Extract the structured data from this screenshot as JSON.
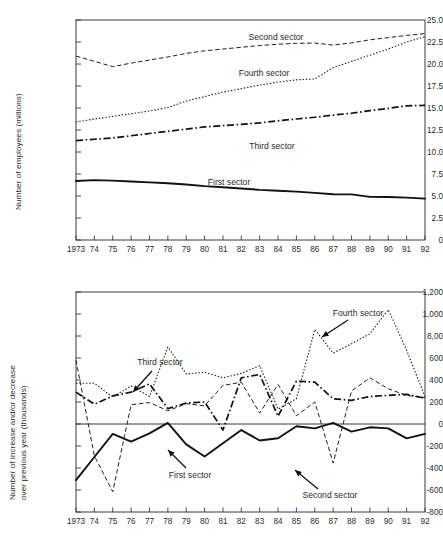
{
  "chart_data": [
    {
      "id": "employees",
      "type": "line",
      "title": "",
      "xlabel": "",
      "ylabel": "Number of employees (millions)",
      "x": [
        1973,
        1974,
        1975,
        1976,
        1977,
        1978,
        1979,
        1980,
        1981,
        1982,
        1983,
        1984,
        1985,
        1986,
        1987,
        1988,
        1989,
        1990,
        1991,
        1992
      ],
      "xticklabels": [
        "1973",
        "74",
        "75",
        "76",
        "77",
        "78",
        "79",
        "80",
        "81",
        "82",
        "83",
        "84",
        "85",
        "86",
        "87",
        "88",
        "89",
        "90",
        "91",
        "92"
      ],
      "yticklabels": [
        "0",
        "2.5",
        "5.0",
        "7.5",
        "10.0",
        "12.5",
        "15.0",
        "17.5",
        "20.0",
        "22.5",
        "25.0"
      ],
      "ytickvalues": [
        0,
        2.5,
        5.0,
        7.5,
        10.0,
        12.5,
        15.0,
        17.5,
        20.0,
        22.5,
        25.0
      ],
      "ylim": [
        0,
        25
      ],
      "xlim": [
        1973,
        1992
      ],
      "grid": false,
      "legend_position": "inline-annotations",
      "series": [
        {
          "name": "First sector",
          "style": "solid",
          "values": [
            6.7,
            6.8,
            6.75,
            6.65,
            6.55,
            6.45,
            6.3,
            6.12,
            6.0,
            5.85,
            5.7,
            5.6,
            5.5,
            5.35,
            5.2,
            5.18,
            4.9,
            4.88,
            4.82,
            4.7
          ]
        },
        {
          "name": "Second sector",
          "style": "dashed",
          "values": [
            20.9,
            20.3,
            19.7,
            20.1,
            20.45,
            20.8,
            21.2,
            21.5,
            21.7,
            21.9,
            22.1,
            22.25,
            22.35,
            22.38,
            22.15,
            22.4,
            22.75,
            23.0,
            23.25,
            23.45
          ]
        },
        {
          "name": "Third sector",
          "style": "dash-dot",
          "values": [
            11.3,
            11.45,
            11.6,
            11.85,
            12.1,
            12.35,
            12.6,
            12.85,
            13.0,
            13.15,
            13.3,
            13.55,
            13.75,
            13.95,
            14.2,
            14.4,
            14.7,
            14.95,
            15.25,
            15.3
          ]
        },
        {
          "name": "Fourth sector",
          "style": "dotted",
          "values": [
            13.4,
            13.75,
            14.05,
            14.35,
            14.65,
            15.05,
            15.8,
            16.3,
            16.8,
            17.2,
            17.6,
            17.95,
            18.2,
            18.3,
            19.6,
            20.3,
            21.0,
            21.7,
            22.5,
            23.1
          ]
        }
      ],
      "annotations": [
        {
          "text": "Second sector",
          "x_px": 276,
          "y_px": 37
        },
        {
          "text": "Fourth sector",
          "x_px": 264,
          "y_px": 73
        },
        {
          "text": "Third sector",
          "x_px": 272,
          "y_px": 146
        },
        {
          "text": "First sector",
          "x_px": 229,
          "y_px": 182
        }
      ]
    },
    {
      "id": "change",
      "type": "line",
      "title": "",
      "xlabel": "",
      "ylabel": "Number of increase and/or decrease over previous year (thousands)",
      "x": [
        1973,
        1974,
        1975,
        1976,
        1977,
        1978,
        1979,
        1980,
        1981,
        1982,
        1983,
        1984,
        1985,
        1986,
        1987,
        1988,
        1989,
        1990,
        1991,
        1992
      ],
      "xticklabels": [
        "1973",
        "74",
        "75",
        "76",
        "77",
        "78",
        "79",
        "80",
        "81",
        "82",
        "83",
        "84",
        "85",
        "86",
        "87",
        "88",
        "89",
        "90",
        "91",
        "92"
      ],
      "yticklabels": [
        "-800",
        "-600",
        "-400",
        "-200",
        "0",
        "200",
        "400",
        "600",
        "8,00",
        "1,000",
        "1,200"
      ],
      "ytickvalues": [
        -800,
        -600,
        -400,
        -200,
        0,
        200,
        400,
        600,
        800,
        1000,
        1200
      ],
      "ylim": [
        -800,
        1200
      ],
      "xlim": [
        1973,
        1992
      ],
      "grid": false,
      "legend_position": "inline-annotations",
      "series": [
        {
          "name": "First sector",
          "style": "solid",
          "values": [
            -510,
            -300,
            -90,
            -160,
            -85,
            10,
            -185,
            -295,
            -175,
            -55,
            -150,
            -130,
            -20,
            -40,
            10,
            -70,
            -30,
            -40,
            -130,
            -90
          ]
        },
        {
          "name": "Second sector",
          "style": "dashed",
          "values": [
            580,
            -290,
            -615,
            175,
            195,
            120,
            185,
            165,
            350,
            380,
            100,
            360,
            75,
            200,
            -355,
            300,
            420,
            320,
            260,
            240
          ]
        },
        {
          "name": "Third sector",
          "style": "dash-dot",
          "values": [
            290,
            180,
            255,
            290,
            365,
            140,
            190,
            200,
            -55,
            420,
            450,
            70,
            390,
            380,
            230,
            215,
            250,
            260,
            270,
            235
          ]
        },
        {
          "name": "Fourth sector",
          "style": "dotted",
          "values": [
            370,
            370,
            245,
            345,
            250,
            700,
            455,
            470,
            420,
            460,
            530,
            135,
            230,
            860,
            645,
            730,
            820,
            1040,
            670,
            250
          ]
        }
      ],
      "annotations": [
        {
          "text": "Third sector",
          "x_px": 160,
          "y_px": 362,
          "arrow_from": [
            152,
            371
          ],
          "arrow_to": [
            133,
            392
          ]
        },
        {
          "text": "Fourth sector",
          "x_px": 358,
          "y_px": 313,
          "arrow_from": [
            348,
            320
          ],
          "arrow_to": [
            322,
            337
          ]
        },
        {
          "text": "First sector",
          "x_px": 190,
          "y_px": 475,
          "arrow_from": [
            186,
            468
          ],
          "arrow_to": [
            168,
            450
          ]
        },
        {
          "text": "Second sector",
          "x_px": 330,
          "y_px": 495,
          "arrow_from": [
            318,
            489
          ],
          "arrow_to": [
            295,
            470
          ]
        }
      ]
    }
  ]
}
